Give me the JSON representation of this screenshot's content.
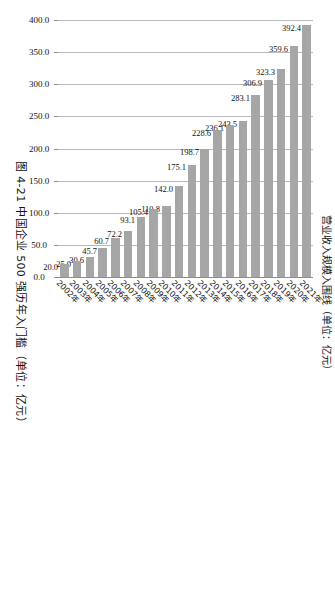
{
  "figure": {
    "caption": "图 4-21  中国企业 500 强历年入门槛（单位：亿元）",
    "axis_title": "营业收入规模入围线（单位：亿元）"
  },
  "chart_data": {
    "type": "bar",
    "orientation": "horizontal",
    "title": "图 4-21  中国企业 500 强历年入门槛（单位：亿元）",
    "xlabel": "营业收入规模入围线（单位：亿元）",
    "ylabel": "",
    "xlim": [
      0,
      400
    ],
    "grid": true,
    "legend": "none",
    "bar_color": "#a6a6a6",
    "gridline_color": "#b9b9b9",
    "tick_labels": [
      "400.0",
      "350.0",
      "300.0",
      "250.0",
      "200.0",
      "150.0",
      "100.0",
      "50.0",
      "0.0"
    ],
    "tick_values": [
      400,
      350,
      300,
      250,
      200,
      150,
      100,
      50,
      0
    ],
    "categories": [
      "2021年",
      "2020年",
      "2019年",
      "2018年",
      "2017年",
      "2016年",
      "2015年",
      "2014年",
      "2013年",
      "2012年",
      "2011年",
      "2010年",
      "2009年",
      "2008年",
      "2007年",
      "2006年",
      "2005年",
      "2004年",
      "2003年",
      "2002年"
    ],
    "values": [
      392.4,
      359.6,
      323.3,
      306.9,
      283.1,
      243.5,
      236.1,
      228.6,
      198.7,
      175.1,
      142.0,
      110.8,
      105.4,
      93.1,
      72.2,
      60.7,
      45.7,
      30.6,
      25.0,
      20.0
    ],
    "data_labels": [
      "392.4",
      "359.6",
      "323.3",
      "306.9",
      "283.1",
      "243.5",
      "236.1",
      "228.6",
      "198.7",
      "175.1",
      "142.0",
      "110.8",
      "105.4",
      "93.1",
      "72.2",
      "60.7",
      "45.7",
      "30.6",
      "25.0",
      "20.0"
    ]
  }
}
